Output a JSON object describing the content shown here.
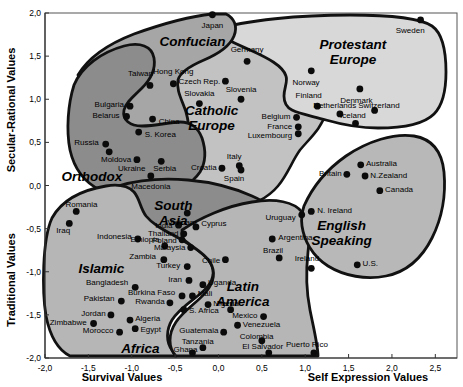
{
  "chart_data": {
    "type": "scatter",
    "title": "",
    "xlabel_left": "Survival Values",
    "xlabel_right": "Self Expression Values",
    "ylabel_top": "Secular-Rational Values",
    "ylabel_bottom": "Traditional Values",
    "xlim": [
      -2.0,
      2.75
    ],
    "ylim": [
      -2.0,
      2.0
    ],
    "grid": false,
    "legend": "none",
    "xticks": [
      -2.0,
      -1.5,
      -1.0,
      -0.5,
      0.0,
      0.5,
      1.0,
      1.5,
      2.0,
      2.5
    ],
    "xticklabels": [
      "-2,0",
      "-1,5",
      "-1,0",
      "-0,5",
      "0,0",
      "0,5",
      "1,0",
      "1,5",
      "2,0",
      "2,5"
    ],
    "yticks": [
      -2.0,
      -1.5,
      -1.0,
      -0.5,
      0.0,
      0.5,
      1.0,
      1.5,
      2.0
    ],
    "yticklabels": [
      "-2,0",
      "-1,5",
      "-1,0",
      "-0,5",
      "0,0",
      "0,5",
      "1,0",
      "1,5",
      "2,0"
    ],
    "cluster_labels": [
      {
        "name": "Confucian",
        "x": -0.3,
        "y": 1.62,
        "fill": "#a8a8a8"
      },
      {
        "name": "Protestant Europe",
        "x": 1.55,
        "y": 1.58,
        "fill": "#d4d4d4"
      },
      {
        "name": "Catholic Europe",
        "x": -0.08,
        "y": 0.82,
        "fill": "#c0c0c0"
      },
      {
        "name": "Orthodox",
        "x": -1.46,
        "y": 0.05,
        "fill": "#8a8a8a"
      },
      {
        "name": "South Asia",
        "x": -0.52,
        "y": -0.28,
        "fill": "#8a8a8a"
      },
      {
        "name": "English Speaking",
        "x": 1.42,
        "y": -0.52,
        "fill": "#b4b4b4"
      },
      {
        "name": "Islamic",
        "x": -1.35,
        "y": -1.02,
        "fill": "#b4b4b4"
      },
      {
        "name": "Latin America",
        "x": 0.28,
        "y": -1.22,
        "fill": "#b4b4b4"
      },
      {
        "name": "Africa",
        "x": -0.9,
        "y": -1.94,
        "fill": "#b4b4b4"
      }
    ],
    "points": [
      {
        "name": "Japan",
        "x": -0.07,
        "y": 1.98,
        "lx": -0.07,
        "ly": 1.86,
        "anchor": "middle"
      },
      {
        "name": "Sweden",
        "x": 2.33,
        "y": 1.92,
        "lx": 2.21,
        "ly": 1.8,
        "anchor": "middle"
      },
      {
        "name": "Hong Kong",
        "x": -0.52,
        "y": 1.18,
        "lx": -0.52,
        "ly": 1.33,
        "anchor": "middle"
      },
      {
        "name": "Taiwan",
        "x": -0.79,
        "y": 1.16,
        "lx": -0.9,
        "ly": 1.3,
        "anchor": "middle"
      },
      {
        "name": "Germany",
        "x": 0.33,
        "y": 1.44,
        "lx": 0.33,
        "ly": 1.58,
        "anchor": "middle"
      },
      {
        "name": "Norway",
        "x": 1.07,
        "y": 1.33,
        "lx": 1.01,
        "ly": 1.2,
        "anchor": "middle"
      },
      {
        "name": "Denmark",
        "x": 1.63,
        "y": 1.12,
        "lx": 1.59,
        "ly": 0.99,
        "anchor": "middle"
      },
      {
        "name": "Czech Rep.",
        "x": 0.08,
        "y": 1.21,
        "lx": 0.02,
        "ly": 1.21,
        "anchor": "end"
      },
      {
        "name": "Bulgaria",
        "x": -1.02,
        "y": 0.92,
        "lx": -1.09,
        "ly": 0.94,
        "anchor": "end"
      },
      {
        "name": "Belarus",
        "x": -1.06,
        "y": 0.8,
        "lx": -1.14,
        "ly": 0.82,
        "anchor": "end"
      },
      {
        "name": "China",
        "x": -0.76,
        "y": 0.77,
        "lx": -0.69,
        "ly": 0.75,
        "anchor": "start"
      },
      {
        "name": "Slovenia",
        "x": 0.26,
        "y": 1.0,
        "lx": 0.26,
        "ly": 1.12,
        "anchor": "middle"
      },
      {
        "name": "Slovakia",
        "x": -0.22,
        "y": 0.95,
        "lx": -0.22,
        "ly": 1.07,
        "anchor": "middle"
      },
      {
        "name": "Finland",
        "x": 1.14,
        "y": 0.92,
        "lx": 1.04,
        "ly": 1.05,
        "anchor": "middle"
      },
      {
        "name": "Netherlands",
        "x": 1.4,
        "y": 0.83,
        "lx": 1.34,
        "ly": 0.93,
        "anchor": "middle"
      },
      {
        "name": "Switzerland",
        "x": 1.8,
        "y": 0.87,
        "lx": 1.85,
        "ly": 0.93,
        "anchor": "middle"
      },
      {
        "name": "Iceland",
        "x": 1.58,
        "y": 0.72,
        "lx": 1.55,
        "ly": 0.82,
        "anchor": "middle"
      },
      {
        "name": "Belgium",
        "x": 0.9,
        "y": 0.79,
        "lx": 0.83,
        "ly": 0.81,
        "anchor": "end"
      },
      {
        "name": "France",
        "x": 0.92,
        "y": 0.68,
        "lx": 0.85,
        "ly": 0.69,
        "anchor": "end"
      },
      {
        "name": "Luxembourg",
        "x": 0.92,
        "y": 0.6,
        "lx": 0.85,
        "ly": 0.58,
        "anchor": "end"
      },
      {
        "name": "S. Korea",
        "x": -0.92,
        "y": 0.62,
        "lx": -0.85,
        "ly": 0.6,
        "anchor": "start"
      },
      {
        "name": "Russia",
        "x": -1.3,
        "y": 0.48,
        "lx": -1.38,
        "ly": 0.51,
        "anchor": "end"
      },
      {
        "name": "Moldova",
        "x": -1.26,
        "y": 0.39,
        "lx": -1.18,
        "ly": 0.31,
        "anchor": "middle"
      },
      {
        "name": "Ukraine",
        "x": -0.94,
        "y": 0.3,
        "lx": -1.0,
        "ly": 0.2,
        "anchor": "middle"
      },
      {
        "name": "Serbia",
        "x": -0.66,
        "y": 0.28,
        "lx": -0.62,
        "ly": 0.2,
        "anchor": "middle"
      },
      {
        "name": "Macedonia",
        "x": -0.78,
        "y": 0.11,
        "lx": -0.78,
        "ly": 0.0,
        "anchor": "middle"
      },
      {
        "name": "Italy",
        "x": 0.24,
        "y": 0.23,
        "lx": 0.18,
        "ly": 0.34,
        "anchor": "middle"
      },
      {
        "name": "Spain",
        "x": 0.26,
        "y": 0.18,
        "lx": 0.18,
        "ly": 0.09,
        "anchor": "middle"
      },
      {
        "name": "Croatia",
        "x": 0.04,
        "y": 0.2,
        "lx": -0.02,
        "ly": 0.21,
        "anchor": "end"
      },
      {
        "name": "Australia",
        "x": 1.64,
        "y": 0.24,
        "lx": 1.7,
        "ly": 0.26,
        "anchor": "start"
      },
      {
        "name": "Britain",
        "x": 1.48,
        "y": 0.13,
        "lx": 1.42,
        "ly": 0.15,
        "anchor": "end"
      },
      {
        "name": "N.Zealand",
        "x": 1.69,
        "y": 0.11,
        "lx": 1.75,
        "ly": 0.12,
        "anchor": "start"
      },
      {
        "name": "Canada",
        "x": 1.86,
        "y": -0.06,
        "lx": 1.92,
        "ly": -0.04,
        "anchor": "start"
      },
      {
        "name": "Romania",
        "x": -1.64,
        "y": -0.3,
        "lx": -1.58,
        "ly": -0.22,
        "anchor": "middle"
      },
      {
        "name": "N. Ireland",
        "x": 1.07,
        "y": -0.3,
        "lx": 1.14,
        "ly": -0.28,
        "anchor": "start"
      },
      {
        "name": "Uruguay",
        "x": 0.96,
        "y": -0.34,
        "lx": 0.89,
        "ly": -0.36,
        "anchor": "end"
      },
      {
        "name": "Vietnam",
        "x": -0.36,
        "y": -0.32,
        "lx": -0.42,
        "ly": -0.42,
        "anchor": "middle"
      },
      {
        "name": "India",
        "x": -0.46,
        "y": -0.46,
        "lx": -0.53,
        "ly": -0.46,
        "anchor": "end"
      },
      {
        "name": "Cyprus",
        "x": -0.26,
        "y": -0.48,
        "lx": -0.2,
        "ly": -0.44,
        "anchor": "start"
      },
      {
        "name": "Iraq",
        "x": -1.72,
        "y": -0.44,
        "lx": -1.79,
        "ly": -0.52,
        "anchor": "middle"
      },
      {
        "name": "Indonesia",
        "x": -0.93,
        "y": -0.62,
        "lx": -1.0,
        "ly": -0.58,
        "anchor": "end"
      },
      {
        "name": "Ethiopia",
        "x": -0.62,
        "y": -0.7,
        "lx": -0.68,
        "ly": -0.62,
        "anchor": "end"
      },
      {
        "name": "Thailand",
        "x": -0.4,
        "y": -0.56,
        "lx": -0.46,
        "ly": -0.55,
        "anchor": "end"
      },
      {
        "name": "Poland",
        "x": -0.42,
        "y": -0.63,
        "lx": -0.48,
        "ly": -0.63,
        "anchor": "end"
      },
      {
        "name": "Malaysia",
        "x": -0.32,
        "y": -0.72,
        "lx": -0.38,
        "ly": -0.71,
        "anchor": "end"
      },
      {
        "name": "Zambia",
        "x": -0.63,
        "y": -0.86,
        "lx": -0.72,
        "ly": -0.82,
        "anchor": "end"
      },
      {
        "name": "Argentina",
        "x": 0.62,
        "y": -0.62,
        "lx": 0.69,
        "ly": -0.6,
        "anchor": "start"
      },
      {
        "name": "Brazil",
        "x": 0.7,
        "y": -0.84,
        "lx": 0.63,
        "ly": -0.75,
        "anchor": "middle"
      },
      {
        "name": "Chile",
        "x": 0.08,
        "y": -0.86,
        "lx": 0.02,
        "ly": -0.86,
        "anchor": "end"
      },
      {
        "name": "Turkey",
        "x": -0.36,
        "y": -0.94,
        "lx": -0.44,
        "ly": -0.92,
        "anchor": "end"
      },
      {
        "name": "Iran",
        "x": -0.34,
        "y": -1.1,
        "lx": -0.42,
        "ly": -1.08,
        "anchor": "end"
      },
      {
        "name": "Uganda",
        "x": -0.18,
        "y": -1.15,
        "lx": -0.12,
        "ly": -1.12,
        "anchor": "start"
      },
      {
        "name": "Bangladesh",
        "x": -0.96,
        "y": -1.18,
        "lx": -1.04,
        "ly": -1.12,
        "anchor": "end"
      },
      {
        "name": "Burkina Faso",
        "x": -0.42,
        "y": -1.28,
        "lx": -0.5,
        "ly": -1.24,
        "anchor": "end"
      },
      {
        "name": "Mali",
        "x": -0.3,
        "y": -1.28,
        "lx": -0.24,
        "ly": -1.25,
        "anchor": "start"
      },
      {
        "name": "Pakistan",
        "x": -1.12,
        "y": -1.34,
        "lx": -1.2,
        "ly": -1.3,
        "anchor": "end"
      },
      {
        "name": "Rwanda",
        "x": -0.56,
        "y": -1.36,
        "lx": -0.62,
        "ly": -1.34,
        "anchor": "end"
      },
      {
        "name": "Nigeria",
        "x": -0.12,
        "y": -1.38,
        "lx": -0.06,
        "ly": -1.36,
        "anchor": "start"
      },
      {
        "name": "S. Africa",
        "x": -0.4,
        "y": -1.44,
        "lx": -0.34,
        "ly": -1.44,
        "anchor": "start"
      },
      {
        "name": "Peru",
        "x": 0.14,
        "y": -1.44,
        "lx": 0.08,
        "ly": -1.36,
        "anchor": "middle"
      },
      {
        "name": "Jordan",
        "x": -1.24,
        "y": -1.5,
        "lx": -1.3,
        "ly": -1.48,
        "anchor": "end"
      },
      {
        "name": "Algeria",
        "x": -1.02,
        "y": -1.56,
        "lx": -0.96,
        "ly": -1.54,
        "anchor": "start"
      },
      {
        "name": "Zimbabwe",
        "x": -1.44,
        "y": -1.6,
        "lx": -1.52,
        "ly": -1.58,
        "anchor": "end"
      },
      {
        "name": "Egypt",
        "x": -0.96,
        "y": -1.66,
        "lx": -0.9,
        "ly": -1.66,
        "anchor": "start"
      },
      {
        "name": "Morocco",
        "x": -1.14,
        "y": -1.7,
        "lx": -1.21,
        "ly": -1.68,
        "anchor": "end"
      },
      {
        "name": "Mexico",
        "x": 0.52,
        "y": -1.52,
        "lx": 0.45,
        "ly": -1.5,
        "anchor": "end"
      },
      {
        "name": "Venezuela",
        "x": 0.22,
        "y": -1.62,
        "lx": 0.28,
        "ly": -1.6,
        "anchor": "start"
      },
      {
        "name": "Guatemala",
        "x": 0.06,
        "y": -1.7,
        "lx": 0.0,
        "ly": -1.68,
        "anchor": "end"
      },
      {
        "name": "Colombia",
        "x": 0.5,
        "y": -1.8,
        "lx": 0.44,
        "ly": -1.74,
        "anchor": "middle"
      },
      {
        "name": "Puerto Rico",
        "x": 1.1,
        "y": -1.94,
        "lx": 1.02,
        "ly": -1.84,
        "anchor": "middle"
      },
      {
        "name": "El Salvador",
        "x": 0.58,
        "y": -1.94,
        "lx": 0.51,
        "ly": -1.86,
        "anchor": "middle"
      },
      {
        "name": "Tanzania",
        "x": -0.18,
        "y": -1.88,
        "lx": -0.24,
        "ly": -1.8,
        "anchor": "middle"
      },
      {
        "name": "Ghana",
        "x": -0.3,
        "y": -1.94,
        "lx": -0.38,
        "ly": -1.9,
        "anchor": "middle"
      },
      {
        "name": "Ireland",
        "x": 1.07,
        "y": -0.96,
        "lx": 1.02,
        "ly": -0.84,
        "anchor": "middle"
      },
      {
        "name": "U.S.",
        "x": 1.6,
        "y": -0.92,
        "lx": 1.66,
        "ly": -0.9,
        "anchor": "start"
      }
    ]
  }
}
